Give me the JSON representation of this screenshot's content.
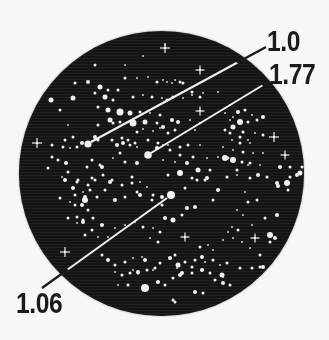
{
  "figure": {
    "description_labels": {
      "top": "1.0",
      "middle": "1.77",
      "bottom": "1.06"
    },
    "colors": {
      "paper": "#f7f7f5",
      "disk": "#141412",
      "star": "#f1f1ee",
      "annotation_outside": "#1b1b1b",
      "annotation_inside": "#f1f1ee"
    },
    "disk": {
      "cx": 161.5,
      "cy": 173.5,
      "r": 142.5,
      "line_split_r": 134
    },
    "labels": [
      {
        "text": "1.0",
        "text_pos": {
          "x": 267,
          "y": 27
        },
        "line": {
          "x1": 91,
          "y1": 142,
          "x2": 266,
          "y2": 47
        },
        "star": {
          "x": 88,
          "y": 144,
          "r": 3.6
        }
      },
      {
        "text": "1.77",
        "text_pos": {
          "x": 269,
          "y": 60
        },
        "line": {
          "x1": 151,
          "y1": 153,
          "x2": 268,
          "y2": 82
        },
        "star": {
          "x": 148,
          "y": 155,
          "r": 3.8
        }
      },
      {
        "text": "1.06",
        "text_pos": {
          "x": 16,
          "y": 289
        },
        "line": {
          "x1": 167,
          "y1": 198,
          "x2": 42,
          "y2": 288
        },
        "star": {
          "x": 171,
          "y": 195,
          "r": 4
        }
      }
    ],
    "spike_stars": [
      [
        37,
        143,
        5
      ],
      [
        165,
        48,
        5
      ],
      [
        200,
        70,
        4.5
      ],
      [
        200,
        111,
        4.5
      ],
      [
        274,
        137,
        5
      ],
      [
        285,
        155,
        4.5
      ],
      [
        65,
        252,
        5
      ],
      [
        185,
        237,
        4.5
      ],
      [
        255,
        238,
        4.5
      ]
    ],
    "stars": [
      [
        51,
        100,
        2.5
      ],
      [
        73,
        98,
        2.5
      ],
      [
        60,
        110,
        1.5
      ],
      [
        88,
        82,
        2
      ],
      [
        75,
        83,
        1.5
      ],
      [
        95,
        93,
        1.5
      ],
      [
        95,
        65,
        1.5
      ],
      [
        125,
        65,
        1
      ],
      [
        125,
        78,
        1.5
      ],
      [
        137,
        78,
        1
      ],
      [
        100,
        87,
        2.5
      ],
      [
        108,
        90,
        1.5
      ],
      [
        105,
        97,
        2.5
      ],
      [
        113,
        100,
        1.5
      ],
      [
        118,
        90,
        1.5
      ],
      [
        143,
        56,
        1
      ],
      [
        165,
        45,
        1
      ],
      [
        148,
        77,
        1
      ],
      [
        157,
        82,
        1.5
      ],
      [
        167,
        82,
        1
      ],
      [
        175,
        80,
        1
      ],
      [
        183,
        83,
        1.5
      ],
      [
        133,
        97,
        1.5
      ],
      [
        143,
        95,
        1
      ],
      [
        152,
        97,
        1.5
      ],
      [
        162,
        98,
        1
      ],
      [
        173,
        97,
        1.5
      ],
      [
        183,
        98,
        1
      ],
      [
        192,
        95,
        1
      ],
      [
        200,
        97,
        1.5
      ],
      [
        98,
        107,
        1.5
      ],
      [
        108,
        110,
        2.5
      ],
      [
        120,
        112,
        3.5
      ],
      [
        130,
        113,
        2.5
      ],
      [
        140,
        112,
        1.5
      ],
      [
        150,
        113,
        1
      ],
      [
        160,
        115,
        1.5
      ],
      [
        110,
        120,
        2.5
      ],
      [
        120,
        122,
        1.5
      ],
      [
        133,
        123,
        3.5
      ],
      [
        145,
        122,
        2.5
      ],
      [
        98,
        125,
        1.5
      ],
      [
        157,
        123,
        1.5
      ],
      [
        190,
        120,
        1
      ],
      [
        200,
        123,
        1
      ],
      [
        113,
        123,
        1.5
      ],
      [
        180,
        82,
        1.5
      ],
      [
        172,
        83,
        1
      ],
      [
        163,
        80,
        1
      ],
      [
        192,
        92,
        1.5
      ],
      [
        203,
        93,
        1
      ],
      [
        218,
        92,
        1
      ],
      [
        167,
        100,
        1.5
      ],
      [
        230,
        105,
        1
      ],
      [
        225,
        113,
        1
      ],
      [
        233,
        117,
        1
      ],
      [
        172,
        120,
        2
      ],
      [
        178,
        122,
        2
      ],
      [
        163,
        127,
        2
      ],
      [
        175,
        130,
        1.5
      ],
      [
        168,
        133,
        1.5
      ],
      [
        195,
        130,
        1
      ],
      [
        230,
        133,
        1.5
      ],
      [
        240,
        137,
        1.5
      ],
      [
        248,
        140,
        1
      ],
      [
        238,
        112,
        2
      ],
      [
        245,
        110,
        1.5
      ],
      [
        252,
        115,
        1
      ],
      [
        230,
        120,
        1
      ],
      [
        240,
        122,
        3
      ],
      [
        248,
        122,
        1.5
      ],
      [
        257,
        120,
        1.5
      ],
      [
        263,
        117,
        2
      ],
      [
        233,
        127,
        2.5
      ],
      [
        225,
        130,
        1.5
      ],
      [
        243,
        132,
        1.5
      ],
      [
        255,
        133,
        1
      ],
      [
        263,
        135,
        1.5
      ],
      [
        68,
        125,
        1
      ],
      [
        82,
        143,
        2
      ],
      [
        63,
        147,
        1.5
      ],
      [
        70,
        148,
        1
      ],
      [
        52,
        157,
        1.5
      ],
      [
        52,
        145,
        1.5
      ],
      [
        65,
        140,
        1.5
      ],
      [
        73,
        137,
        1.5
      ],
      [
        77,
        147,
        1.5
      ],
      [
        98,
        140,
        1.5
      ],
      [
        112,
        140,
        1.5
      ],
      [
        122,
        138,
        1.5
      ],
      [
        128,
        140,
        1.5
      ],
      [
        135,
        143,
        1.5
      ],
      [
        148,
        140,
        1.5
      ],
      [
        158,
        143,
        1.5
      ],
      [
        58,
        160,
        1.5
      ],
      [
        48,
        168,
        1.5
      ],
      [
        66,
        163,
        2
      ],
      [
        68,
        172,
        1.5
      ],
      [
        62,
        177,
        1
      ],
      [
        78,
        180,
        1.5
      ],
      [
        73,
        188,
        2
      ],
      [
        83,
        192,
        1
      ],
      [
        88,
        185,
        1.5
      ],
      [
        60,
        198,
        1.5
      ],
      [
        70,
        202,
        1
      ],
      [
        82,
        205,
        2
      ],
      [
        88,
        210,
        1.5
      ],
      [
        68,
        218,
        1.5
      ],
      [
        77,
        223,
        1
      ],
      [
        83,
        220,
        1.5
      ],
      [
        95,
        137,
        2
      ],
      [
        117,
        145,
        2
      ],
      [
        123,
        143,
        2
      ],
      [
        130,
        145,
        1.5
      ],
      [
        137,
        147,
        1
      ],
      [
        120,
        153,
        1.5
      ],
      [
        113,
        158,
        1
      ],
      [
        125,
        162,
        1.5
      ],
      [
        137,
        163,
        2
      ],
      [
        157,
        148,
        2
      ],
      [
        163,
        145,
        1
      ],
      [
        170,
        150,
        1.5
      ],
      [
        102,
        167,
        2
      ],
      [
        103,
        175,
        1.5
      ],
      [
        95,
        180,
        1.5
      ],
      [
        110,
        182,
        2
      ],
      [
        90,
        190,
        1.5
      ],
      [
        85,
        197,
        2
      ],
      [
        75,
        195,
        1.5
      ],
      [
        132,
        177,
        1.5
      ],
      [
        140,
        182,
        1
      ],
      [
        147,
        187,
        1
      ],
      [
        137,
        192,
        1.5
      ],
      [
        153,
        195,
        1.5
      ],
      [
        162,
        197,
        2
      ],
      [
        87,
        167,
        1.5
      ],
      [
        92,
        160,
        1.5
      ],
      [
        100,
        165,
        1.5
      ],
      [
        137,
        132,
        1.5
      ],
      [
        143,
        129,
        1
      ],
      [
        153,
        131,
        1
      ],
      [
        160,
        128,
        1
      ],
      [
        168,
        145,
        1
      ],
      [
        180,
        147,
        1.5
      ],
      [
        188,
        145,
        1.5
      ],
      [
        200,
        145,
        1
      ],
      [
        180,
        155,
        1.5
      ],
      [
        193,
        157,
        1.5
      ],
      [
        207,
        158,
        1
      ],
      [
        218,
        157,
        1
      ],
      [
        228,
        158,
        1.5
      ],
      [
        163,
        160,
        1
      ],
      [
        175,
        162,
        1
      ],
      [
        187,
        163,
        2
      ],
      [
        198,
        170,
        2.5
      ],
      [
        210,
        170,
        1.5
      ],
      [
        237,
        170,
        1.5
      ],
      [
        248,
        165,
        1
      ],
      [
        180,
        173,
        3
      ],
      [
        168,
        175,
        1.5
      ],
      [
        192,
        178,
        1.5
      ],
      [
        205,
        180,
        1.5
      ],
      [
        232,
        140,
        1
      ],
      [
        240,
        143,
        1.5
      ],
      [
        250,
        143,
        1
      ],
      [
        223,
        147,
        1
      ],
      [
        233,
        150,
        1
      ],
      [
        243,
        152,
        1.5
      ],
      [
        253,
        153,
        1
      ],
      [
        263,
        153,
        1
      ],
      [
        225,
        158,
        3
      ],
      [
        233,
        160,
        3
      ],
      [
        242,
        162,
        1.5
      ],
      [
        250,
        163,
        1.5
      ],
      [
        260,
        165,
        1
      ],
      [
        290,
        167,
        1.5
      ],
      [
        297,
        175,
        2
      ],
      [
        258,
        175,
        2
      ],
      [
        267,
        177,
        1.5
      ],
      [
        250,
        178,
        1.5
      ],
      [
        237,
        175,
        1
      ],
      [
        227,
        177,
        1.5
      ],
      [
        277,
        183,
        2
      ],
      [
        287,
        183,
        3
      ],
      [
        300,
        173,
        2.5
      ],
      [
        290,
        177,
        1.5
      ],
      [
        302,
        167,
        1.5
      ],
      [
        280,
        167,
        2
      ],
      [
        65,
        180,
        2
      ],
      [
        77,
        182,
        1.5
      ],
      [
        92,
        178,
        1.5
      ],
      [
        112,
        180,
        1.5
      ],
      [
        122,
        185,
        1.5
      ],
      [
        132,
        183,
        1.5
      ],
      [
        85,
        200,
        3
      ],
      [
        75,
        205,
        1.5
      ],
      [
        97,
        197,
        1.5
      ],
      [
        105,
        190,
        1.5
      ],
      [
        115,
        200,
        2
      ],
      [
        125,
        197,
        1.5
      ],
      [
        140,
        195,
        2
      ],
      [
        152,
        200,
        1.5
      ],
      [
        162,
        205,
        1.5
      ],
      [
        77,
        217,
        1.5
      ],
      [
        83,
        222,
        2
      ],
      [
        93,
        218,
        1.5
      ],
      [
        102,
        225,
        2
      ],
      [
        92,
        230,
        1.5
      ],
      [
        85,
        235,
        1.5
      ],
      [
        98,
        237,
        1
      ],
      [
        108,
        237,
        1
      ],
      [
        115,
        228,
        1
      ],
      [
        125,
        225,
        1
      ],
      [
        135,
        222,
        1
      ],
      [
        143,
        227,
        1.5
      ],
      [
        153,
        228,
        1
      ],
      [
        160,
        232,
        1.5
      ],
      [
        150,
        238,
        1
      ],
      [
        158,
        242,
        1.5
      ],
      [
        102,
        255,
        1.5
      ],
      [
        108,
        260,
        2
      ],
      [
        115,
        265,
        1.5
      ],
      [
        125,
        262,
        1.5
      ],
      [
        133,
        258,
        1
      ],
      [
        142,
        257,
        1
      ],
      [
        115,
        272,
        1
      ],
      [
        122,
        275,
        1.5
      ],
      [
        130,
        273,
        1.5
      ],
      [
        138,
        272,
        2
      ],
      [
        147,
        270,
        1.5
      ],
      [
        155,
        268,
        1.5
      ],
      [
        145,
        288,
        4
      ],
      [
        158,
        282,
        2
      ],
      [
        128,
        285,
        1.5
      ],
      [
        118,
        285,
        1
      ],
      [
        145,
        260,
        2
      ],
      [
        160,
        263,
        1.5
      ],
      [
        133,
        270,
        1
      ],
      [
        138,
        273,
        1.5
      ],
      [
        153,
        270,
        1
      ],
      [
        170,
        258,
        2
      ],
      [
        177,
        268,
        1
      ],
      [
        182,
        273,
        2
      ],
      [
        192,
        273,
        1.5
      ],
      [
        202,
        270,
        2
      ],
      [
        205,
        262,
        1
      ],
      [
        213,
        260,
        1.5
      ],
      [
        220,
        265,
        1
      ],
      [
        227,
        263,
        1.5
      ],
      [
        215,
        280,
        1.5
      ],
      [
        223,
        277,
        1
      ],
      [
        230,
        285,
        1.5
      ],
      [
        165,
        285,
        1.5
      ],
      [
        173,
        300,
        1.5
      ],
      [
        195,
        292,
        2
      ],
      [
        203,
        293,
        1.5
      ],
      [
        175,
        302,
        1.5
      ],
      [
        185,
        188,
        1.5
      ],
      [
        197,
        180,
        1.5
      ],
      [
        207,
        178,
        2
      ],
      [
        218,
        190,
        2
      ],
      [
        213,
        200,
        1.5
      ],
      [
        195,
        207,
        2
      ],
      [
        187,
        208,
        2
      ],
      [
        182,
        215,
        1.5
      ],
      [
        173,
        220,
        2.5
      ],
      [
        165,
        218,
        2
      ],
      [
        245,
        192,
        1
      ],
      [
        248,
        202,
        1.5
      ],
      [
        237,
        210,
        1
      ],
      [
        243,
        215,
        1
      ],
      [
        278,
        186,
        2
      ],
      [
        288,
        190,
        1.5
      ],
      [
        257,
        200,
        1.5
      ],
      [
        277,
        215,
        2
      ],
      [
        265,
        218,
        1.5
      ],
      [
        252,
        225,
        1
      ],
      [
        270,
        235,
        3
      ],
      [
        275,
        238,
        2
      ],
      [
        270,
        242,
        1.5
      ],
      [
        200,
        247,
        1.5
      ],
      [
        208,
        245,
        1
      ],
      [
        213,
        250,
        1
      ],
      [
        223,
        240,
        1
      ],
      [
        228,
        232,
        1
      ],
      [
        232,
        227,
        1
      ],
      [
        238,
        230,
        1.5
      ],
      [
        233,
        238,
        1
      ],
      [
        242,
        242,
        1
      ],
      [
        202,
        257,
        2
      ],
      [
        195,
        260,
        1.5
      ],
      [
        175,
        255,
        1.5
      ],
      [
        178,
        265,
        2.5
      ],
      [
        185,
        262,
        1.5
      ],
      [
        192,
        267,
        1.5
      ],
      [
        210,
        273,
        1.5
      ],
      [
        180,
        275,
        2
      ],
      [
        173,
        278,
        1.5
      ],
      [
        222,
        275,
        2.5
      ],
      [
        223,
        283,
        2
      ],
      [
        240,
        268,
        1.5
      ],
      [
        260,
        267,
        1.5
      ],
      [
        250,
        248,
        1
      ],
      [
        260,
        255,
        1.5
      ],
      [
        263,
        267,
        2
      ],
      [
        252,
        268,
        1.5
      ]
    ]
  }
}
